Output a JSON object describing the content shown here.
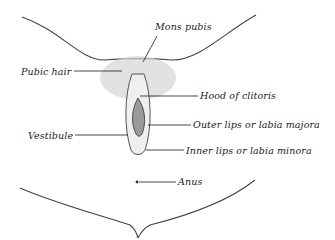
{
  "diagram": {
    "type": "anatomical-illustration",
    "style": "monochrome line engraving",
    "labels": [
      {
        "id": "mons-pubis",
        "text": "Mons pubis",
        "side": "right"
      },
      {
        "id": "pubic-hair",
        "text": "Pubic hair",
        "side": "left"
      },
      {
        "id": "hood-of-clitoris",
        "text": "Hood of clitoris",
        "side": "right"
      },
      {
        "id": "vestibule",
        "text": "Vestibule",
        "side": "left"
      },
      {
        "id": "outer-lips",
        "text": "Outer lips or labia majora",
        "side": "right"
      },
      {
        "id": "inner-lips",
        "text": "Inner lips or labia minora",
        "side": "right"
      },
      {
        "id": "anus",
        "text": "Anus",
        "side": "right"
      }
    ],
    "colors": {
      "ink": "#1a1a1a",
      "shade": "#bdbdbd",
      "background": "#ffffff"
    }
  }
}
